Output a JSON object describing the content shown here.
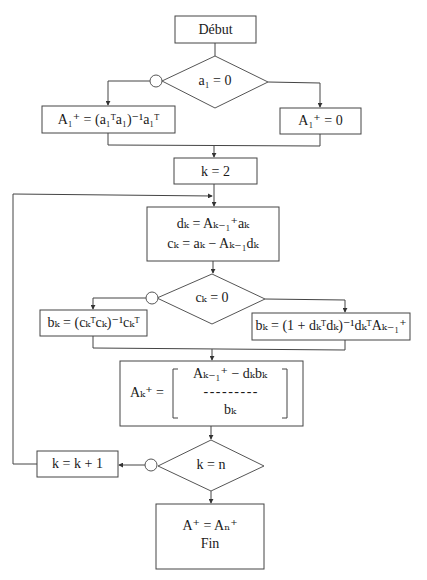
{
  "diagram": {
    "type": "flowchart",
    "colors": {
      "stroke": "#444444",
      "background": "#ffffff",
      "text": "#1a1a1a"
    },
    "nodes": {
      "start": {
        "label": "Début"
      },
      "cond_a1": {
        "label": "a₁ = 0"
      },
      "init_nonzero": {
        "label": "A₁⁺ = (a₁ᵀa₁)⁻¹a₁ᵀ"
      },
      "init_zero": {
        "label": "A₁⁺ = 0"
      },
      "set_k": {
        "label": "k = 2"
      },
      "compute_dc": {
        "line1": "dₖ = Aₖ₋₁⁺aₖ",
        "line2": "cₖ = aₖ − Aₖ₋₁dₖ"
      },
      "cond_ck": {
        "label": "cₖ = 0"
      },
      "bk_nonzero": {
        "label": "bₖ = (cₖᵀcₖ)⁻¹cₖᵀ"
      },
      "bk_zero": {
        "label": "bₖ = (1 + dₖᵀdₖ)⁻¹dₖᵀAₖ₋₁⁺"
      },
      "update_A": {
        "lhs": "Aₖ⁺ =",
        "top": "Aₖ₋₁⁺ − dₖbₖ",
        "separator": "- - - - - - - - -",
        "bottom": "bₖ"
      },
      "cond_kn": {
        "label": "k = n"
      },
      "increment_k": {
        "label": "k = k + 1"
      },
      "end": {
        "line1": "A⁺ = Aₙ⁺",
        "line2": "Fin"
      }
    },
    "edges": [
      {
        "from": "start",
        "to": "cond_a1"
      },
      {
        "from": "cond_a1",
        "to": "init_nonzero",
        "branch": "false (circle)"
      },
      {
        "from": "cond_a1",
        "to": "init_zero",
        "branch": "true"
      },
      {
        "from": "init_nonzero",
        "to": "set_k"
      },
      {
        "from": "init_zero",
        "to": "set_k"
      },
      {
        "from": "set_k",
        "to": "compute_dc"
      },
      {
        "from": "compute_dc",
        "to": "cond_ck"
      },
      {
        "from": "cond_ck",
        "to": "bk_nonzero",
        "branch": "false (circle)"
      },
      {
        "from": "cond_ck",
        "to": "bk_zero",
        "branch": "true"
      },
      {
        "from": "bk_nonzero",
        "to": "update_A"
      },
      {
        "from": "bk_zero",
        "to": "update_A"
      },
      {
        "from": "update_A",
        "to": "cond_kn"
      },
      {
        "from": "cond_kn",
        "to": "increment_k",
        "branch": "false (circle)"
      },
      {
        "from": "cond_kn",
        "to": "end",
        "branch": "true"
      },
      {
        "from": "increment_k",
        "to": "compute_dc",
        "branch": "loop"
      }
    ]
  }
}
